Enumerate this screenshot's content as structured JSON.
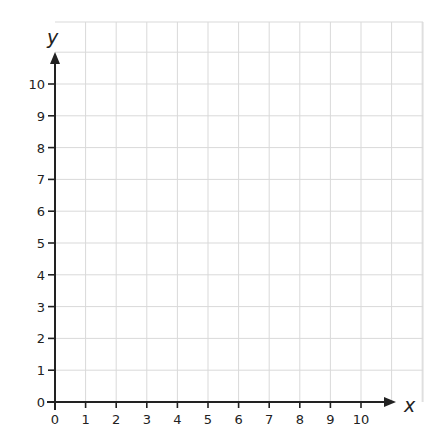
{
  "chart_data": {
    "type": "scatter",
    "title": "",
    "xlabel": "x",
    "ylabel": "y",
    "xlim": [
      0,
      11
    ],
    "ylim": [
      0,
      12
    ],
    "x_ticks": [
      0,
      1,
      2,
      3,
      4,
      5,
      6,
      7,
      8,
      9,
      10
    ],
    "y_ticks": [
      0,
      1,
      2,
      3,
      4,
      5,
      6,
      7,
      8,
      9,
      10
    ],
    "x_tick_labels": [
      "0",
      "1",
      "2",
      "3",
      "4",
      "5",
      "6",
      "7",
      "8",
      "9",
      "10"
    ],
    "y_tick_labels": [
      "0",
      "1",
      "2",
      "3",
      "4",
      "5",
      "6",
      "7",
      "8",
      "9",
      "10"
    ],
    "grid": true,
    "series": [],
    "legend": null
  },
  "colors": {
    "axis": "#222222",
    "grid": "#d9d9d9",
    "background": "#ffffff"
  }
}
